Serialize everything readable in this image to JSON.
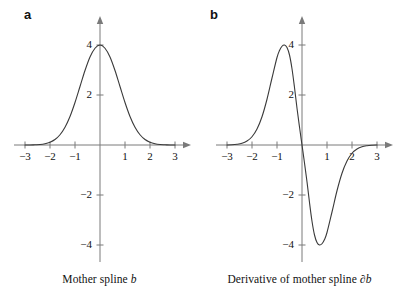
{
  "figure": {
    "background_color": "#ffffff",
    "axis_color": "#7a7a7a",
    "curve_color": "#3a3a3a",
    "text_color": "#111111"
  },
  "panels": [
    {
      "label": "a",
      "caption_prefix": "Mother spline ",
      "caption_symbol": "b",
      "caption_full": "Mother spline b"
    },
    {
      "label": "b",
      "caption_prefix": "Derivative of mother spline ",
      "caption_symbol": "∂b",
      "caption_full": "Derivative of mother spline ∂b"
    }
  ],
  "axes": {
    "x_tick_labels": [
      "−3",
      "−2",
      "−1",
      "1",
      "2",
      "3"
    ],
    "x_tick_values": [
      -3,
      -2,
      -1,
      1,
      2,
      3
    ],
    "y_tick_labels": [
      "4",
      "2",
      "−2",
      "−4"
    ],
    "y_tick_values": [
      4,
      2,
      -2,
      -4
    ],
    "xlim": [
      -3.4,
      3.4
    ],
    "ylim": [
      -5.2,
      4.8
    ],
    "units_per_pixel": 25,
    "grid": false,
    "arrowheads": true
  },
  "chart_data": [
    {
      "type": "line",
      "title": "Mother spline b",
      "panel": "a",
      "xlabel": "",
      "ylabel": "",
      "xlim": [
        -3.4,
        3.4
      ],
      "ylim": [
        -5.2,
        4.8
      ],
      "grid": false,
      "legend": "none",
      "annotations": [
        "peak value 4 at x = 0",
        "decays to ~0 for |x| > 2"
      ],
      "series": [
        {
          "name": "b",
          "x": [
            -3.0,
            -2.8,
            -2.6,
            -2.4,
            -2.2,
            -2.0,
            -1.8,
            -1.6,
            -1.4,
            -1.2,
            -1.0,
            -0.8,
            -0.6,
            -0.4,
            -0.2,
            0.0,
            0.2,
            0.4,
            0.6,
            0.8,
            1.0,
            1.2,
            1.4,
            1.6,
            1.8,
            2.0,
            2.2,
            2.4,
            2.6,
            2.8,
            3.0
          ],
          "y": [
            0.0,
            0.0,
            0.01,
            0.02,
            0.05,
            0.11,
            0.22,
            0.41,
            0.71,
            1.14,
            1.7,
            2.34,
            2.98,
            3.52,
            3.87,
            4.0,
            3.87,
            3.52,
            2.98,
            2.34,
            1.7,
            1.14,
            0.71,
            0.41,
            0.22,
            0.11,
            0.05,
            0.02,
            0.01,
            0.0,
            0.0
          ]
        }
      ]
    },
    {
      "type": "line",
      "title": "Derivative of mother spline ∂b",
      "panel": "b",
      "xlabel": "",
      "ylabel": "",
      "xlim": [
        -3.4,
        3.4
      ],
      "ylim": [
        -5.2,
        4.8
      ],
      "grid": false,
      "legend": "none",
      "annotations": [
        "maximum 4 near x = -0.7",
        "zero crossing at x = 0",
        "minimum -4 near x = 0.7"
      ],
      "series": [
        {
          "name": "∂b",
          "x": [
            -3.0,
            -2.8,
            -2.6,
            -2.4,
            -2.2,
            -2.0,
            -1.8,
            -1.6,
            -1.4,
            -1.2,
            -1.0,
            -0.9,
            -0.8,
            -0.7,
            -0.6,
            -0.5,
            -0.4,
            -0.3,
            -0.2,
            -0.1,
            0.0,
            0.1,
            0.2,
            0.3,
            0.4,
            0.5,
            0.6,
            0.7,
            0.8,
            0.9,
            1.0,
            1.2,
            1.4,
            1.6,
            1.8,
            2.0,
            2.2,
            2.4,
            2.6,
            2.8,
            3.0
          ],
          "y": [
            0.0,
            0.01,
            0.03,
            0.07,
            0.16,
            0.33,
            0.64,
            1.13,
            1.83,
            2.68,
            3.5,
            3.78,
            3.95,
            4.0,
            3.9,
            3.6,
            3.05,
            2.3,
            1.47,
            0.72,
            0.0,
            -0.72,
            -1.47,
            -2.3,
            -3.05,
            -3.6,
            -3.9,
            -4.0,
            -3.95,
            -3.78,
            -3.5,
            -2.68,
            -1.83,
            -1.13,
            -0.64,
            -0.33,
            -0.16,
            -0.07,
            -0.03,
            -0.01,
            0.0
          ]
        }
      ]
    }
  ]
}
